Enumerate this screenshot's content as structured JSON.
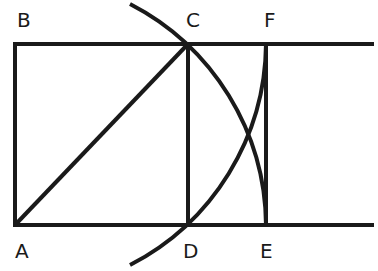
{
  "diagram": {
    "stroke_color": "#1a1a1a",
    "background": "#ffffff",
    "points": {
      "A": {
        "label": "A",
        "x": 15,
        "y": 225
      },
      "B": {
        "label": "B",
        "x": 15,
        "y": 44
      },
      "C": {
        "label": "C",
        "x": 188,
        "y": 44
      },
      "D": {
        "label": "D",
        "x": 188,
        "y": 225
      },
      "E": {
        "label": "E",
        "x": 266,
        "y": 225
      },
      "F": {
        "label": "F",
        "x": 266,
        "y": 44
      }
    },
    "labels": {
      "A": "A",
      "B": "B",
      "C": "C",
      "D": "D",
      "E": "E",
      "F": "F"
    }
  }
}
